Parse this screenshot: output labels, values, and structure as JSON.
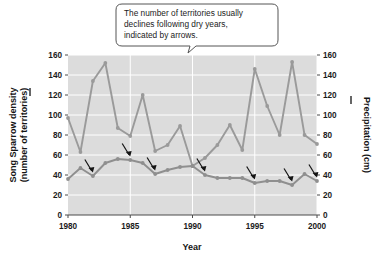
{
  "callout": {
    "lines": [
      "The number of territories usually",
      "declines following dry years,",
      "indicated by arrows."
    ]
  },
  "chart_data": {
    "type": "line",
    "title": "",
    "xlabel": "Year",
    "ylabel": "Song Sparrow density (number of territories)",
    "y2label": "Precipitation (cm)",
    "xlim": [
      1980,
      2000
    ],
    "ylim": [
      0,
      160
    ],
    "y2lim": [
      0,
      160
    ],
    "xticks": [
      1980,
      1985,
      1990,
      1995,
      2000
    ],
    "yticks": [
      0,
      20,
      40,
      60,
      80,
      100,
      120,
      140,
      160
    ],
    "y2ticks": [
      0,
      20,
      40,
      60,
      80,
      100,
      120,
      140,
      160
    ],
    "grid": true,
    "gridcolor": "#ffffff",
    "plot_background": "#dcdcdc",
    "legend": "none",
    "x": [
      1980,
      1981,
      1982,
      1983,
      1984,
      1985,
      1986,
      1987,
      1988,
      1989,
      1990,
      1991,
      1992,
      1993,
      1994,
      1995,
      1996,
      1997,
      1998,
      1999,
      2000
    ],
    "series": [
      {
        "name": "Precipitation (cm)",
        "axis": "right",
        "color": "#9a9a9a",
        "values": [
          97,
          63,
          134,
          152,
          87,
          79,
          120,
          64,
          70,
          89,
          49,
          57,
          70,
          90,
          65,
          146,
          109,
          80,
          153,
          80,
          71
        ]
      },
      {
        "name": "Song Sparrow density (number of territories)",
        "axis": "left",
        "color": "#8f8f8f",
        "values": [
          36,
          47,
          39,
          52,
          56,
          55,
          52,
          41,
          45,
          48,
          49,
          40,
          37,
          37,
          37,
          32,
          34,
          34,
          30,
          41,
          34
        ]
      }
    ],
    "annotations": {
      "type": "arrows",
      "note": "Arrows indicate declines in territories following dry years",
      "target_years": [
        1982,
        1985,
        1987,
        1991,
        1995,
        1998,
        2000
      ]
    }
  },
  "axis_labels": {
    "x_title": "Year",
    "y_left_title_line1": "Song Sparrow density",
    "y_left_title_line2": "(number of territories)",
    "y_right_title": "Precipitation (cm)"
  },
  "colors": {
    "plot_bg": "#dcdcdc",
    "grid": "#ffffff",
    "line": "#9a9a9a",
    "text": "#1b1b1b",
    "callout_border": "#555555"
  }
}
